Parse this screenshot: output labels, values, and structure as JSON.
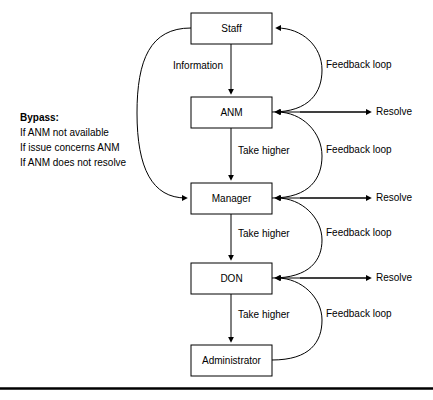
{
  "diagram": {
    "type": "flowchart",
    "background_color": "#ffffff",
    "line_color": "#000000",
    "nodes": [
      {
        "id": "staff",
        "label": "Staff",
        "x": 191,
        "y": 13,
        "w": 81,
        "h": 31
      },
      {
        "id": "anm",
        "label": "ANM",
        "x": 191,
        "y": 97,
        "w": 81,
        "h": 31
      },
      {
        "id": "manager",
        "label": "Manager",
        "x": 191,
        "y": 183,
        "w": 81,
        "h": 31
      },
      {
        "id": "don",
        "label": "DON",
        "x": 191,
        "y": 263,
        "w": 81,
        "h": 31
      },
      {
        "id": "administrator",
        "label": "Administrator",
        "x": 191,
        "y": 345,
        "w": 81,
        "h": 31
      }
    ],
    "vertical_edges": [
      {
        "id": "staff-to-anm",
        "from": "staff",
        "to": "anm",
        "label": "Information"
      },
      {
        "id": "anm-to-manager",
        "from": "anm",
        "to": "manager",
        "label": "Take higher"
      },
      {
        "id": "manager-to-don",
        "from": "manager",
        "to": "don",
        "label": "Take higher"
      },
      {
        "id": "don-to-admin",
        "from": "don",
        "to": "administrator",
        "label": "Take higher"
      }
    ],
    "feedback_loops": [
      {
        "id": "feedback-anm-staff",
        "from": "anm",
        "to": "staff",
        "label": "Feedback loop"
      },
      {
        "id": "feedback-manager-anm",
        "from": "manager",
        "to": "anm",
        "label": "Feedback loop"
      },
      {
        "id": "feedback-don-manager",
        "from": "don",
        "to": "manager",
        "label": "Feedback loop"
      },
      {
        "id": "feedback-admin-don",
        "from": "administrator",
        "to": "don",
        "label": "Feedback loop"
      }
    ],
    "resolve_edges": [
      {
        "id": "resolve-anm",
        "target": "anm",
        "label": "Resolve"
      },
      {
        "id": "resolve-manager",
        "target": "manager",
        "label": "Resolve"
      },
      {
        "id": "resolve-don",
        "target": "don",
        "label": "Resolve"
      }
    ],
    "bypass": {
      "id": "bypass-path",
      "from": "staff",
      "to": "manager",
      "title": "Bypass:",
      "conditions": [
        "If ANM not available",
        "If issue concerns ANM",
        "If ANM does not resolve"
      ]
    }
  }
}
